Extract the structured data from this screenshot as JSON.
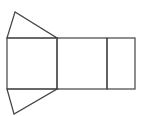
{
  "diagram": {
    "stroke_color": "#444444",
    "background": "#ffffff",
    "shapes": {
      "top_triangle": {
        "points": "15,12 7,38 57,38"
      },
      "bottom_triangle": {
        "points": "7,89 57,89 14,114"
      },
      "left_square": {
        "x": 7,
        "y": 38,
        "width": 50,
        "height": 51
      },
      "middle_rect": {
        "x": 57,
        "y": 38,
        "width": 50,
        "height": 51
      },
      "right_rect": {
        "x": 107,
        "y": 38,
        "width": 28,
        "height": 51
      }
    }
  }
}
